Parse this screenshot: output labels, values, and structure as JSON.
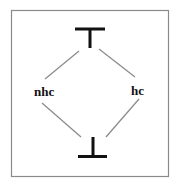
{
  "diagram": {
    "type": "lattice",
    "nodes": {
      "top": {
        "symbol": "top",
        "label": "⊤",
        "x": 90,
        "y": 38
      },
      "left": {
        "symbol": "text",
        "label": "nhc",
        "x": 44,
        "y": 95
      },
      "right": {
        "symbol": "text",
        "label": "hc",
        "x": 138,
        "y": 94
      },
      "bottom": {
        "symbol": "bottom",
        "label": "⊥",
        "x": 93,
        "y": 147
      }
    },
    "edges": [
      {
        "from": "top",
        "to": "left"
      },
      {
        "from": "top",
        "to": "right"
      },
      {
        "from": "left",
        "to": "bottom"
      },
      {
        "from": "right",
        "to": "bottom"
      }
    ],
    "colors": {
      "frame": "#8a8a8a",
      "edge": "#8c8c8c",
      "symbol": "#111111",
      "text": "#111111",
      "background": "#ffffff"
    }
  }
}
